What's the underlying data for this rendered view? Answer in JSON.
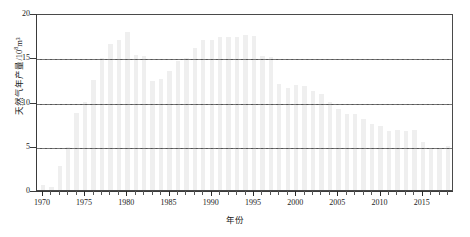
{
  "chart_data": {
    "type": "bar",
    "title": "",
    "xlabel": "年份",
    "ylabel": "天然气年产量/10⁸m³",
    "ylabel_text": "天然气年产量/10",
    "ylabel_exp": "8",
    "ylabel_unit": "m³",
    "xlim": [
      1969.3,
      2018.7
    ],
    "ylim": [
      0,
      20
    ],
    "yticks": [
      0,
      5,
      10,
      15,
      20
    ],
    "ytick_labels": [
      "0",
      "5",
      "10",
      "15",
      "20"
    ],
    "xticks": [
      1970,
      1975,
      1980,
      1985,
      1990,
      1995,
      2000,
      2005,
      2010,
      2015
    ],
    "xtick_labels": [
      "1970",
      "1975",
      "1980",
      "1985",
      "1990",
      "1995",
      "2000",
      "2005",
      "2010",
      "2015"
    ],
    "xtick_minor_step": 1,
    "grid": "horizontal-dashed",
    "legend": "none",
    "bar_color": "#efefef",
    "axis_color": "#3a3a3a",
    "gridline_color": "#555555",
    "categories": [
      1970,
      1971,
      1972,
      1973,
      1974,
      1975,
      1976,
      1977,
      1978,
      1979,
      1980,
      1981,
      1982,
      1983,
      1984,
      1985,
      1986,
      1987,
      1988,
      1989,
      1990,
      1991,
      1992,
      1993,
      1994,
      1995,
      1996,
      1997,
      1998,
      1999,
      2000,
      2001,
      2002,
      2003,
      2004,
      2005,
      2006,
      2007,
      2008,
      2009,
      2010,
      2011,
      2012,
      2013,
      2014,
      2015,
      2016,
      2017,
      2018
    ],
    "values": [
      0.6,
      0.3,
      2.7,
      4.9,
      8.7,
      9.9,
      12.4,
      14.9,
      16.5,
      16.9,
      17.8,
      15.2,
      15.1,
      12.3,
      12.5,
      13.4,
      14.6,
      14.9,
      16.0,
      17.0,
      16.9,
      17.3,
      17.3,
      17.3,
      17.5,
      17.4,
      15.1,
      15.0,
      12.0,
      11.5,
      11.9,
      11.7,
      11.2,
      10.9,
      10.0,
      9.2,
      8.6,
      8.6,
      8.0,
      7.5,
      7.2,
      6.7,
      6.8,
      6.7,
      6.8,
      5.4,
      4.6,
      4.6,
      5.0
    ],
    "peak_value": 17.8,
    "peak_year": 1980,
    "min_value": 0.3,
    "min_year": 1971
  }
}
